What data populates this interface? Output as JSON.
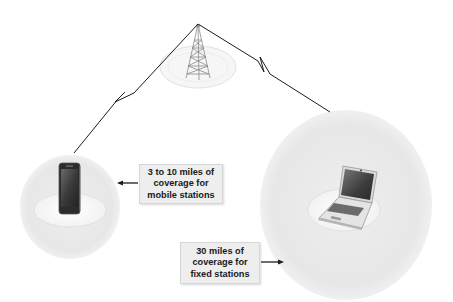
{
  "diagram": {
    "nodes": [
      {
        "id": "tower",
        "type": "base-station-tower"
      },
      {
        "id": "mobile",
        "type": "mobile-phone",
        "coverage_zone": "small"
      },
      {
        "id": "fixed",
        "type": "laptop",
        "coverage_zone": "large"
      }
    ],
    "links": [
      {
        "from": "tower",
        "to": "mobile",
        "style": "wireless-lightning"
      },
      {
        "from": "tower",
        "to": "fixed",
        "style": "wireless-lightning"
      }
    ],
    "labels": {
      "mobile": {
        "lines": [
          "3 to 10 miles of",
          "coverage for",
          "mobile stations"
        ],
        "arrow_direction": "left"
      },
      "fixed": {
        "lines": [
          "30 miles of",
          "coverage for",
          "fixed stations"
        ],
        "arrow_direction": "right"
      }
    },
    "colors": {
      "coverage_fill": "#e9e9e9",
      "platform_fill": "#f7f7f7",
      "link_line": "#1c1c1c",
      "label_bg": "#eeeeee",
      "label_text": "#1a1a1a"
    }
  }
}
